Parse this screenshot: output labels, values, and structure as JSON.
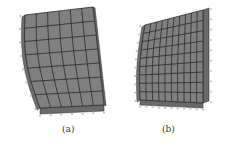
{
  "figure": {
    "panels": [
      {
        "label": "(a)",
        "mesh": {
          "columns": 6,
          "rows": 7,
          "face_color": "#808080",
          "side_color": "#6a6a6a",
          "line_color": "#2a2a2a",
          "top": [
            [
              25,
              15
            ],
            [
              93,
              7
            ]
          ],
          "bottom": [
            [
              40,
              108
            ],
            [
              104,
              105
            ]
          ],
          "depth": [
            5,
            3
          ]
        }
      },
      {
        "label": "(b)",
        "mesh": {
          "columns": 10,
          "rows": 9,
          "face_color": "#808080",
          "side_color": "#6a6a6a",
          "line_color": "#2a2a2a",
          "top": [
            [
              145,
              25
            ],
            [
              203,
              10
            ]
          ],
          "bottom": [
            [
              140,
              100
            ],
            [
              203,
              103
            ]
          ],
          "depth": [
            7,
            -3
          ]
        }
      }
    ]
  }
}
